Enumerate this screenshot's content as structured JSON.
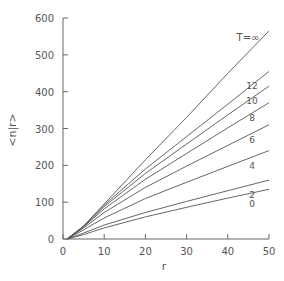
{
  "chart_data": {
    "type": "line",
    "title": "",
    "xlabel": "r",
    "ylabel": "<n|r>",
    "xlim": [
      0,
      50
    ],
    "ylim": [
      0,
      600
    ],
    "xticks": [
      0,
      10,
      20,
      30,
      40,
      50
    ],
    "yticks": [
      0,
      100,
      200,
      300,
      400,
      500,
      600
    ],
    "grid": false,
    "legend": "inline labels at right end of lines",
    "series": [
      {
        "name": "T=∞",
        "label": "T=∞",
        "x": [
          1,
          5,
          10,
          20,
          30,
          40,
          50
        ],
        "values": [
          0,
          35,
          95,
          215,
          330,
          450,
          565
        ]
      },
      {
        "name": "12",
        "label": "12",
        "x": [
          1,
          5,
          10,
          20,
          30,
          40,
          50
        ],
        "values": [
          0,
          35,
          92,
          190,
          278,
          366,
          455
        ]
      },
      {
        "name": "10",
        "label": "10",
        "x": [
          1,
          5,
          10,
          20,
          30,
          40,
          50
        ],
        "values": [
          0,
          34,
          88,
          178,
          258,
          337,
          415
        ]
      },
      {
        "name": "8",
        "label": "8",
        "x": [
          1,
          5,
          10,
          20,
          30,
          40,
          50
        ],
        "values": [
          0,
          33,
          82,
          162,
          232,
          302,
          370
        ]
      },
      {
        "name": "6",
        "label": "6",
        "x": [
          1,
          5,
          10,
          20,
          30,
          40,
          50
        ],
        "values": [
          0,
          30,
          72,
          140,
          198,
          254,
          310
        ]
      },
      {
        "name": "4",
        "label": "4",
        "x": [
          1,
          5,
          10,
          20,
          30,
          40,
          50
        ],
        "values": [
          0,
          25,
          57,
          110,
          154,
          197,
          240
        ]
      },
      {
        "name": "2",
        "label": "2",
        "x": [
          1,
          5,
          10,
          20,
          30,
          40,
          50
        ],
        "values": [
          0,
          16,
          38,
          72,
          102,
          131,
          160
        ]
      },
      {
        "name": "0",
        "label": "0",
        "x": [
          1,
          5,
          10,
          20,
          30,
          40,
          50
        ],
        "values": [
          0,
          12,
          30,
          60,
          86,
          111,
          135
        ]
      }
    ]
  },
  "labels": {
    "xlabel": "r",
    "ylabel": "<n|r>"
  }
}
